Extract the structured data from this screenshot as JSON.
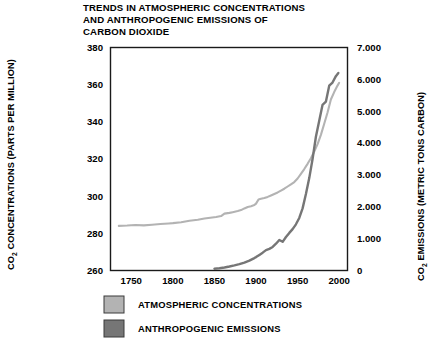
{
  "chart_data": {
    "type": "line",
    "title": "TRENDS IN ATMOSPHERIC CONCENTRATIONS AND ANTHROPOGENIC EMISSIONS OF CARBON DIOXIDE",
    "title_lines": [
      "TRENDS IN ATMOSPHERIC CONCENTRATIONS",
      "AND ANTHROPOGENIC EMISSIONS OF",
      "CARBON DIOXIDE"
    ],
    "xlabel": "",
    "ylabel_left": "CO2 CONCENTRATIONS (PARTS PER MILLION)",
    "ylabel_left_parts": {
      "prefix": "CO",
      "subscript": "2",
      "suffix": " CONCENTRATIONS (PARTS PER MILLION)"
    },
    "ylabel_right": "CO2 EMISSIONS (METRIC TONS CARBON)",
    "ylabel_right_parts": {
      "prefix": "CO",
      "subscript": "2",
      "suffix": " EMISSIONS (METRIC TONS CARBON)"
    },
    "xlim": [
      1725,
      2010
    ],
    "xticks": [
      1750,
      1800,
      1850,
      1900,
      1950,
      2000
    ],
    "xtick_labels": [
      "1750",
      "1800",
      "1850",
      "1900",
      "1950",
      "2000"
    ],
    "ylim_left": [
      260,
      380
    ],
    "yticks_left": [
      260,
      280,
      300,
      320,
      340,
      360,
      380
    ],
    "ytick_labels_left": [
      "260",
      "280",
      "300",
      "320",
      "340",
      "360",
      "380"
    ],
    "ylim_right": [
      0,
      7000
    ],
    "yticks_right": [
      0,
      1000,
      2000,
      3000,
      4000,
      5000,
      6000,
      7000
    ],
    "ytick_labels_right": [
      "0",
      "1.000",
      "2.000",
      "3.000",
      "4.000",
      "5.000",
      "6.000",
      "7.000"
    ],
    "grid": false,
    "legend_position": "below-left",
    "colors": {
      "concentrations": "#b3b3b3",
      "emissions": "#767676",
      "frame": "#1a1a1a",
      "text": "#000000",
      "background": "#ffffff"
    },
    "series": [
      {
        "name": "ATMOSPHERIC CONCENTRATIONS",
        "axis": "left",
        "units": "parts per million",
        "color": "#b3b3b3",
        "x": [
          1735,
          1745,
          1755,
          1765,
          1775,
          1785,
          1795,
          1800,
          1810,
          1820,
          1830,
          1838,
          1845,
          1852,
          1858,
          1862,
          1868,
          1872,
          1878,
          1882,
          1886,
          1890,
          1894,
          1898,
          1900,
          1903,
          1906,
          1910,
          1914,
          1918,
          1922,
          1926,
          1930,
          1934,
          1938,
          1942,
          1946,
          1950,
          1954,
          1958,
          1962,
          1966,
          1970,
          1974,
          1978,
          1982,
          1986,
          1990,
          1994,
          1998,
          2000
        ],
        "y": [
          284.0,
          284.2,
          284.5,
          284.3,
          284.6,
          285.0,
          285.3,
          285.5,
          286.0,
          286.8,
          287.3,
          288.0,
          288.4,
          288.8,
          289.3,
          290.6,
          291.0,
          291.4,
          292.0,
          292.5,
          293.4,
          294.2,
          294.6,
          295.2,
          296.0,
          298.2,
          298.6,
          299.0,
          299.6,
          300.4,
          301.2,
          302.0,
          303.0,
          304.0,
          305.2,
          306.4,
          307.6,
          309.5,
          312.0,
          314.6,
          317.4,
          320.4,
          324.0,
          328.0,
          333.0,
          339.0,
          345.0,
          352.0,
          356.0,
          359.5,
          361.0
        ]
      },
      {
        "name": "ANTHROPOGENIC EMISSIONS",
        "axis": "right",
        "units": "metric tons carbon",
        "color": "#767676",
        "x": [
          1850,
          1856,
          1862,
          1868,
          1874,
          1880,
          1886,
          1892,
          1898,
          1900,
          1904,
          1908,
          1912,
          1916,
          1920,
          1924,
          1928,
          1932,
          1936,
          1940,
          1944,
          1948,
          1952,
          1956,
          1960,
          1964,
          1968,
          1972,
          1976,
          1980,
          1984,
          1988,
          1992,
          1996,
          1999
        ],
        "y": [
          55,
          70,
          95,
          125,
          160,
          200,
          250,
          310,
          390,
          420,
          490,
          560,
          640,
          680,
          740,
          840,
          960,
          900,
          1050,
          1180,
          1300,
          1450,
          1650,
          1950,
          2400,
          2900,
          3500,
          4200,
          4700,
          5200,
          5300,
          5800,
          5900,
          6100,
          6200
        ]
      }
    ],
    "legend": [
      {
        "label": "ATMOSPHERIC CONCENTRATIONS",
        "color": "#b3b3b3"
      },
      {
        "label": "ANTHROPOGENIC EMISSIONS",
        "color": "#767676"
      }
    ]
  }
}
